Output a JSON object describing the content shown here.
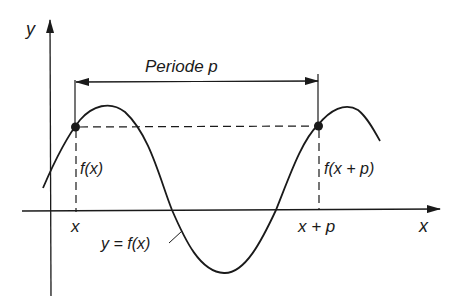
{
  "diagram": {
    "title": "Periode p",
    "axis_labels": {
      "x": "x",
      "y": "y"
    },
    "tick_labels": {
      "x": "x",
      "x_plus_p": "x + p"
    },
    "point_labels": {
      "left": "f(x)",
      "right": "f(x + p)"
    },
    "curve_label": "y = f(x)",
    "colors": {
      "stroke": "#1a1a1a",
      "background": "#ffffff"
    }
  }
}
